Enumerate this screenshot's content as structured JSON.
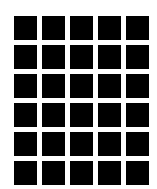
{
  "grid": {
    "rows": 6,
    "columns": 5,
    "cell_color": "#000000",
    "background_color": "#ffffff"
  }
}
